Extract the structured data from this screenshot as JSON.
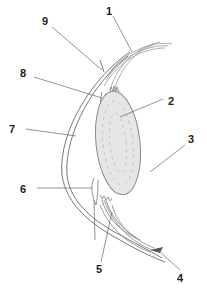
{
  "diagram": {
    "labels": [
      {
        "id": "1",
        "text": "1",
        "x": 106,
        "y": 6
      },
      {
        "id": "2",
        "text": "2",
        "x": 168,
        "y": 96
      },
      {
        "id": "3",
        "text": "3",
        "x": 188,
        "y": 134
      },
      {
        "id": "4",
        "text": "4",
        "x": 177,
        "y": 273
      },
      {
        "id": "5",
        "text": "5",
        "x": 96,
        "y": 264
      },
      {
        "id": "6",
        "text": "6",
        "x": 20,
        "y": 184
      },
      {
        "id": "7",
        "text": "7",
        "x": 9,
        "y": 124
      },
      {
        "id": "8",
        "text": "8",
        "x": 20,
        "y": 68
      },
      {
        "id": "9",
        "text": "9",
        "x": 42,
        "y": 16
      }
    ],
    "colors": {
      "line": "#777777",
      "leader": "#666666",
      "lens_fill": "#e6e6e6",
      "lens_stroke": "#8a8a8a",
      "text": "#222222",
      "dark_tip": "#555555"
    }
  }
}
